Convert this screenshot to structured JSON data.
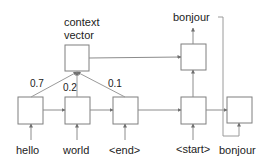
{
  "diagram": {
    "context": {
      "label_line1": "context",
      "label_line2": "vector"
    },
    "weights": [
      "0.7",
      "0.2",
      "0.1"
    ],
    "encoder_inputs": [
      "hello",
      "world",
      "<end>"
    ],
    "decoder_inputs": [
      "<start>",
      "bonjour"
    ],
    "decoder_output": "bonjour",
    "colors": {
      "box_stroke": "#7f7f7f",
      "line": "#8c8c8c",
      "arrow": "#7f7f7f"
    }
  }
}
